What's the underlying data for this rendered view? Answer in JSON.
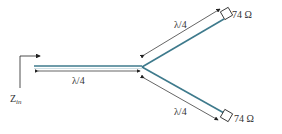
{
  "diagram": {
    "input_label": "Z",
    "input_sub": "in",
    "main_length": "λ/4",
    "upper_length": "λ/4",
    "lower_length": "λ/4",
    "upper_load": "74 Ω",
    "lower_load": "74 Ω",
    "line_color": "#3e7a8c"
  }
}
